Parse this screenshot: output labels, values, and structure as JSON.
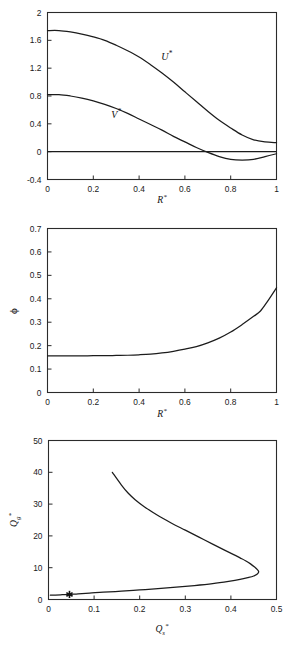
{
  "page": {
    "background": "#ffffff",
    "line_color": "#1c1c1c",
    "axis_color": "#2b2b2b"
  },
  "chart_data": [
    {
      "id": "velocity-profiles",
      "type": "line",
      "title": "",
      "xlabel": "R*",
      "ylabel": "",
      "xlim": [
        0,
        1
      ],
      "ylim": [
        -0.4,
        2
      ],
      "xticks": [
        0,
        0.2,
        0.4,
        0.6,
        0.8,
        1
      ],
      "xticklabels": [
        "0",
        "0.2",
        "0.4",
        "0.6",
        "0.8",
        "1"
      ],
      "yticks": [
        -0.4,
        0,
        0.4,
        0.8,
        1.2,
        1.6,
        2
      ],
      "yticklabels": [
        "-0.4",
        "0",
        "0.4",
        "0.8",
        "1.2",
        "1.6",
        "2"
      ],
      "grid": false,
      "legend": "inline-curve-labels",
      "annotations": [
        {
          "text": "U*",
          "x": 0.52,
          "y": 1.32
        },
        {
          "text": "V*",
          "x": 0.3,
          "y": 0.49
        }
      ],
      "series": [
        {
          "name": "U*",
          "label": "U*",
          "x": [
            0.0,
            0.05,
            0.1,
            0.15,
            0.2,
            0.25,
            0.3,
            0.35,
            0.4,
            0.45,
            0.5,
            0.55,
            0.6,
            0.65,
            0.7,
            0.75,
            0.8,
            0.85,
            0.9,
            0.95,
            1.0
          ],
          "y": [
            1.74,
            1.74,
            1.72,
            1.69,
            1.65,
            1.6,
            1.53,
            1.45,
            1.36,
            1.25,
            1.13,
            1.0,
            0.86,
            0.72,
            0.58,
            0.45,
            0.34,
            0.24,
            0.17,
            0.14,
            0.13
          ]
        },
        {
          "name": "V*",
          "label": "V*",
          "x": [
            0.0,
            0.05,
            0.1,
            0.15,
            0.2,
            0.25,
            0.3,
            0.35,
            0.4,
            0.45,
            0.5,
            0.55,
            0.6,
            0.65,
            0.7,
            0.75,
            0.8,
            0.85,
            0.9,
            0.95,
            1.0
          ],
          "y": [
            0.82,
            0.82,
            0.8,
            0.77,
            0.73,
            0.68,
            0.62,
            0.55,
            0.47,
            0.39,
            0.31,
            0.22,
            0.14,
            0.06,
            -0.01,
            -0.07,
            -0.11,
            -0.12,
            -0.11,
            -0.07,
            -0.03
          ]
        },
        {
          "name": "zero-reference",
          "label": "0",
          "x": [
            0,
            1
          ],
          "y": [
            0,
            0
          ]
        }
      ]
    },
    {
      "id": "voidage-profile",
      "type": "line",
      "title": "",
      "xlabel": "R*",
      "ylabel": "ϕ",
      "xlim": [
        0,
        1
      ],
      "ylim": [
        0,
        0.7
      ],
      "xticks": [
        0,
        0.2,
        0.4,
        0.6,
        0.8,
        1
      ],
      "xticklabels": [
        "0",
        "0.2",
        "0.4",
        "0.6",
        "0.8",
        "1"
      ],
      "yticks": [
        0,
        0.1,
        0.2,
        0.3,
        0.4,
        0.5,
        0.6,
        0.7
      ],
      "yticklabels": [
        "0",
        "0.1",
        "0.2",
        "0.3",
        "0.4",
        "0.5",
        "0.6",
        "0.7"
      ],
      "grid": false,
      "series": [
        {
          "name": "phi",
          "label": "ϕ",
          "x": [
            0.0,
            0.05,
            0.1,
            0.15,
            0.2,
            0.25,
            0.3,
            0.35,
            0.4,
            0.45,
            0.5,
            0.55,
            0.6,
            0.65,
            0.7,
            0.75,
            0.8,
            0.85,
            0.9,
            0.93,
            0.96,
            1.0
          ],
          "y": [
            0.156,
            0.156,
            0.156,
            0.156,
            0.157,
            0.157,
            0.158,
            0.159,
            0.161,
            0.164,
            0.169,
            0.176,
            0.185,
            0.196,
            0.212,
            0.232,
            0.258,
            0.29,
            0.325,
            0.348,
            0.388,
            0.447
          ]
        }
      ]
    },
    {
      "id": "gas-solids-flux",
      "type": "line",
      "title": "",
      "xlabel": "Q*s",
      "ylabel": "Q*g",
      "xlim": [
        0,
        0.5
      ],
      "ylim": [
        0,
        50
      ],
      "xticks": [
        0,
        0.1,
        0.2,
        0.3,
        0.4,
        0.5
      ],
      "xticklabels": [
        "0",
        "0.1",
        "0.2",
        "0.3",
        "0.4",
        "0.5"
      ],
      "yticks": [
        0,
        10,
        20,
        30,
        40,
        50
      ],
      "yticklabels": [
        "0",
        "10",
        "20",
        "30",
        "40",
        "50"
      ],
      "grid": false,
      "markers": [
        {
          "symbol": "asterisk",
          "x": 0.046,
          "y": 1.6
        }
      ],
      "series": [
        {
          "name": "operating-curve",
          "label": "Q*g vs Q*s",
          "x": [
            0.14,
            0.16,
            0.175,
            0.19,
            0.21,
            0.24,
            0.27,
            0.3,
            0.33,
            0.36,
            0.385,
            0.405,
            0.42,
            0.432,
            0.443,
            0.452,
            0.458,
            0.461,
            0.458,
            0.45,
            0.438,
            0.42,
            0.395,
            0.36,
            0.32,
            0.28,
            0.24,
            0.2,
            0.16,
            0.12,
            0.09,
            0.065,
            0.046,
            0.03,
            0.015,
            0.004
          ],
          "y": [
            40.0,
            36.0,
            33.4,
            31.4,
            29.2,
            26.4,
            24.0,
            21.8,
            19.6,
            17.4,
            15.6,
            14.2,
            13.1,
            12.2,
            11.2,
            10.2,
            9.4,
            8.7,
            8.0,
            7.4,
            6.9,
            6.3,
            5.7,
            5.0,
            4.4,
            3.9,
            3.4,
            3.0,
            2.6,
            2.3,
            2.0,
            1.8,
            1.6,
            1.5,
            1.4,
            1.35
          ]
        }
      ]
    }
  ]
}
